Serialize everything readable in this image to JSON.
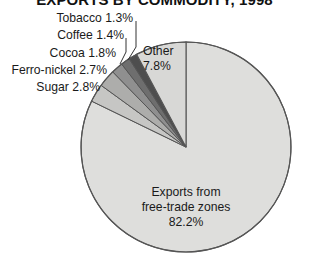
{
  "title": "EXPORTS BY COMMODITY, 1998",
  "chart_data": {
    "type": "pie",
    "title": "EXPORTS BY COMMODITY, 1998",
    "xlabel": "",
    "ylabel": "",
    "units": "percent",
    "total": 100.0,
    "legend_position": "none",
    "grid": false,
    "start_angle_deg": 0,
    "direction": "counterclockwise",
    "categories": [
      "Other",
      "Tobacco",
      "Coffee",
      "Cocoa",
      "Ferro-nickel",
      "Sugar",
      "Exports from free-trade zones"
    ],
    "values": [
      7.8,
      1.3,
      1.4,
      1.8,
      2.7,
      2.8,
      82.2
    ],
    "slices": [
      {
        "name": "Other",
        "label": "Other",
        "value_label": "7.8%",
        "value": 7.8,
        "color": "#d8d8d6",
        "label_placement": "inside"
      },
      {
        "name": "Tobacco",
        "label": "Tobacco",
        "value_label": "1.3%",
        "value": 1.3,
        "color": "#4e4e4e",
        "label_placement": "callout"
      },
      {
        "name": "Coffee",
        "label": "Coffee",
        "value_label": "1.4%",
        "value": 1.4,
        "color": "#6e6e6e",
        "label_placement": "callout"
      },
      {
        "name": "Cocoa",
        "label": "Cocoa",
        "value_label": "1.8%",
        "value": 1.8,
        "color": "#8f8f8f",
        "label_placement": "callout"
      },
      {
        "name": "Ferro-nickel",
        "label": "Ferro-nickel",
        "value_label": "2.7%",
        "value": 2.7,
        "color": "#adadab",
        "label_placement": "callout"
      },
      {
        "name": "Sugar",
        "label": "Sugar",
        "value_label": "2.8%",
        "value": 2.8,
        "color": "#c6c6c4",
        "label_placement": "callout"
      },
      {
        "name": "Exports from free-trade zones",
        "label": "Exports from free-trade zones",
        "value_label": "82.2%",
        "value": 82.2,
        "color": "#dededc",
        "label_placement": "inside"
      }
    ]
  },
  "labels": {
    "tobacco": "Tobacco 1.3%",
    "coffee": "Coffee 1.4%",
    "cocoa": "Cocoa 1.8%",
    "ferro_nickel": "Ferro-nickel 2.7%",
    "sugar": "Sugar 2.8%",
    "other_name": "Other",
    "other_value": "7.8%",
    "main_line1": "Exports from",
    "main_line2": "free-trade zones",
    "main_value": "82.2%"
  },
  "colors": {
    "background": "#ffffff",
    "outline": "#555555",
    "text": "#1a1a1a",
    "slice_main": "#dededc",
    "slice_other": "#d8d8d6",
    "slice_sugar": "#c6c6c4",
    "slice_ferro": "#adadab",
    "slice_cocoa": "#8f8f8f",
    "slice_coffee": "#6e6e6e",
    "slice_tobacco": "#4e4e4e"
  }
}
